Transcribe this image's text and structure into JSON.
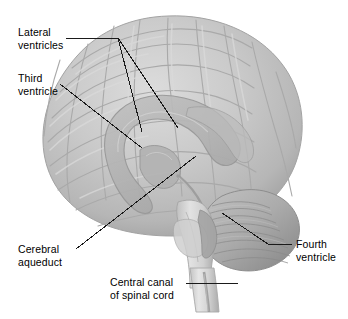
{
  "figure": {
    "background_color": "#ffffff",
    "width": 348,
    "height": 319
  },
  "colors": {
    "brain_base": "#c6c6c6",
    "brain_light": "#d8d8d8",
    "brain_mid": "#bdbdbd",
    "brain_shadow": "#9d9d9d",
    "brain_outline": "#a8a8a8",
    "sulcus_line": "#adadad",
    "ventricle_fill": "#b4b4b4",
    "ventricle_outline": "#9a9a9a",
    "cerebellum": "#b0b0b0",
    "cerebellum_stripe": "#8f8f8f",
    "brainstem": "#d2d2d2",
    "spinal_cord": "#dcdcdc",
    "central_canal": "#9b9b9b",
    "leader_line": "#1a1a1a",
    "label_text": "#000000"
  },
  "labels": [
    {
      "id": "lateral-ventricles",
      "text": "Lateral\nventricles",
      "x": 18,
      "y": 26,
      "anatomy": "lateral ventricles"
    },
    {
      "id": "third-ventricle",
      "text": "Third\nventricle",
      "x": 18,
      "y": 72,
      "anatomy": "third ventricle"
    },
    {
      "id": "cerebral-aqueduct",
      "text": "Cerebral\naqueduct",
      "x": 18,
      "y": 243,
      "anatomy": "cerebral aqueduct"
    },
    {
      "id": "central-canal-of-spinal-cord",
      "text": "Central canal\nof spinal cord",
      "x": 110,
      "y": 276,
      "anatomy": "central canal of spinal cord"
    },
    {
      "id": "fourth-ventricle",
      "text": "Fourth\nventricle",
      "x": 296,
      "y": 238,
      "anatomy": "fourth ventricle"
    }
  ],
  "leader_lines": [
    {
      "id": "leader-lateral-ventricles-stem",
      "points": "66,38 118,38"
    },
    {
      "id": "leader-lateral-ventricles-branch-a",
      "points": "118,38 142,132"
    },
    {
      "id": "leader-lateral-ventricles-branch-b",
      "points": "118,38 178,128"
    },
    {
      "id": "leader-third-ventricle",
      "points": "60,84 142,148"
    },
    {
      "id": "leader-cerebral-aqueduct",
      "points": "76,249 196,156"
    },
    {
      "id": "leader-central-canal",
      "points": "186,283 238,283"
    },
    {
      "id": "leader-fourth-ventricle-diagonal",
      "points": "222,213 268,244"
    },
    {
      "id": "leader-fourth-ventricle-horizontal",
      "points": "268,244 292,244"
    }
  ],
  "anatomy_parts": [
    {
      "id": "cerebrum",
      "name": "cerebrum"
    },
    {
      "id": "cerebellum",
      "name": "cerebellum"
    },
    {
      "id": "brainstem",
      "name": "brainstem"
    },
    {
      "id": "spinal-cord",
      "name": "spinal cord"
    },
    {
      "id": "lateral-ventricle-shape",
      "name": "lateral ventricle"
    },
    {
      "id": "third-ventricle-shape",
      "name": "third ventricle"
    },
    {
      "id": "fourth-ventricle-shape",
      "name": "fourth ventricle"
    },
    {
      "id": "cerebral-aqueduct-shape",
      "name": "cerebral aqueduct"
    },
    {
      "id": "central-canal-shape",
      "name": "central canal"
    }
  ]
}
